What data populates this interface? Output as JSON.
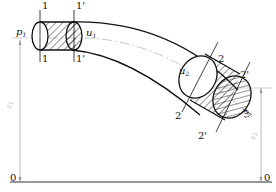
{
  "diagram": {
    "type": "fluid-flow-pipe-bernoulli",
    "sections": {
      "s1": "1",
      "s1p": "1'",
      "s2": "2",
      "s2p": "2'"
    },
    "labels": {
      "p1_main": "p",
      "p1_sub": "1",
      "u1_main": "u",
      "u1_sub": "1",
      "u2_main": "u",
      "u2_sub": "2",
      "p2_main": "p",
      "p2_sub": "2",
      "z1_main": "z",
      "z1_sub": "1",
      "z2_main": "z",
      "z2_sub": "2",
      "datum_left": "0",
      "datum_right": "0"
    },
    "colors": {
      "line": "#111111",
      "centerline": "#bbbbbb",
      "dim": "#999999"
    }
  }
}
